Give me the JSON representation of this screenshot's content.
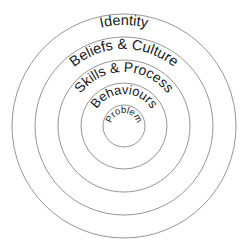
{
  "diagram": {
    "type": "concentric-circles",
    "center": {
      "x": 124,
      "y": 126
    },
    "stroke_color": "#8a8a8a",
    "text_color": "#1a1a1a",
    "rings": [
      {
        "label": "Identity",
        "radius": 112,
        "text_radius": 101,
        "font_size": 14.5
      },
      {
        "label": "Beliefs & Culture",
        "radius": 89,
        "text_radius": 77,
        "font_size": 14.5
      },
      {
        "label": "Skills & Process",
        "radius": 66,
        "text_radius": 54,
        "font_size": 14
      },
      {
        "label": "Behaviours",
        "radius": 43,
        "text_radius": 32,
        "font_size": 13
      },
      {
        "label": "Problem",
        "radius": 21,
        "text_radius": 13,
        "font_size": 9.5
      }
    ]
  }
}
